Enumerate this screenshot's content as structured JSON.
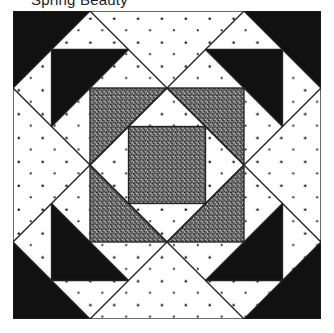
{
  "title": "Spring Beauty",
  "colors": {
    "background": "#ffffff",
    "dark": "#111111",
    "stipple": "#1a1a1a",
    "line": "#222222"
  },
  "block": {
    "grid_units": 8,
    "pieces": {
      "corner_triangles": [
        "top-left",
        "top-right",
        "bottom-left",
        "bottom-right"
      ],
      "flying_triangles": [
        "top-left",
        "top-right",
        "bottom-left",
        "bottom-right"
      ],
      "middle_square": "stippled square-in-a-square",
      "inner_diamond": "white dotted",
      "center_square": "stippled"
    }
  }
}
